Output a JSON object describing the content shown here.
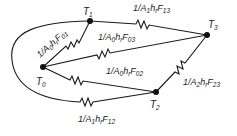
{
  "diagram": {
    "type": "radiation-network",
    "nodes": [
      {
        "id": "T0",
        "label": "T",
        "sub": "0"
      },
      {
        "id": "T1",
        "label": "T",
        "sub": "1"
      },
      {
        "id": "T2",
        "label": "T",
        "sub": "2"
      },
      {
        "id": "T3",
        "label": "T",
        "sub": "3"
      }
    ],
    "resistors": [
      {
        "id": "R01",
        "from": "T0",
        "to": "T1",
        "pre": "1/A",
        "a": "0",
        "mid": "h",
        "r": "r",
        "F": "F",
        "fsub": "01"
      },
      {
        "id": "R03",
        "from": "T0",
        "to": "T3",
        "pre": "1/A",
        "a": "0",
        "mid": "h",
        "r": "r",
        "F": "F",
        "fsub": "03"
      },
      {
        "id": "R02",
        "from": "T0",
        "to": "T2",
        "pre": "1/A",
        "a": "0",
        "mid": "h",
        "r": "r",
        "F": "F",
        "fsub": "02"
      },
      {
        "id": "R13",
        "from": "T1",
        "to": "T3",
        "pre": "1/A",
        "a": "1",
        "mid": "h",
        "r": "r",
        "F": "F",
        "fsub": "13"
      },
      {
        "id": "R23",
        "from": "T2",
        "to": "T3",
        "pre": "1/A",
        "a": "2",
        "mid": "h",
        "r": "r",
        "F": "F",
        "fsub": "23"
      },
      {
        "id": "R12",
        "from": "T1",
        "to": "T2",
        "pre": "1/A",
        "a": "1",
        "mid": "h",
        "r": "r",
        "F": "F",
        "fsub": "12"
      }
    ]
  }
}
